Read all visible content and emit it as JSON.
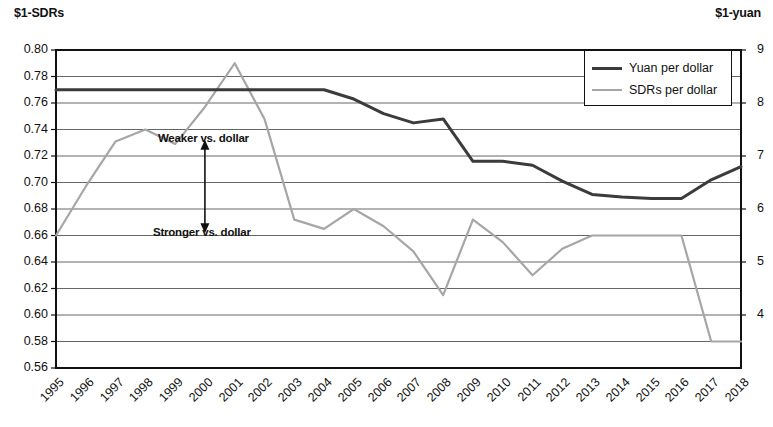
{
  "chart_data": {
    "type": "line",
    "title": "",
    "xlabel": "",
    "ylabel": "$1-SDRs",
    "y2label": "$1-yuan",
    "grid": true,
    "legend_position": "top-right",
    "categories": [
      "1995",
      "1996",
      "1997",
      "1998",
      "1999",
      "2000",
      "2001",
      "2002",
      "2003",
      "2004",
      "2005",
      "2006",
      "2007",
      "2008",
      "2009",
      "2010",
      "2011",
      "2012",
      "2013",
      "2014",
      "2015",
      "2016",
      "2017",
      "2018"
    ],
    "ylim": [
      0.56,
      0.8
    ],
    "yticks": [
      "0.80",
      "0.78",
      "0.76",
      "0.74",
      "0.72",
      "0.70",
      "0.68",
      "0.66",
      "0.64",
      "0.62",
      "0.60",
      "0.58",
      "0.56"
    ],
    "y2lim": [
      3.0,
      9.0
    ],
    "y2ticks": [
      "9",
      "8",
      "7",
      "6",
      "5",
      "4"
    ],
    "series": [
      {
        "name": "Yuan per dollar",
        "color": "#3b3b3b",
        "axis": "left",
        "values": [
          0.77,
          0.77,
          0.77,
          0.77,
          0.77,
          0.77,
          0.77,
          0.77,
          0.77,
          0.77,
          0.763,
          0.752,
          0.745,
          0.748,
          0.716,
          0.716,
          0.713,
          0.701,
          0.691,
          0.689,
          0.688,
          0.688,
          0.702,
          0.712
        ]
      },
      {
        "name": "SDRs per dollar",
        "color": "#a6a6a6",
        "axis": "left",
        "values": [
          0.66,
          0.697,
          0.731,
          0.74,
          0.729,
          0.757,
          0.79,
          0.748,
          0.672,
          0.665,
          0.68,
          0.667,
          0.648,
          0.615,
          0.672,
          0.655,
          0.63,
          0.65,
          0.66,
          0.66,
          0.66,
          0.66,
          0.58,
          0.58
        ]
      }
    ],
    "annotations": [
      {
        "name": "weaker-label",
        "text": "Weaker vs. dollar",
        "x": "2000",
        "y": 0.733
      },
      {
        "name": "stronger-label",
        "text": "Stronger vs. dollar",
        "x": "2000",
        "y": 0.662
      },
      {
        "name": "direction-arrow",
        "text": "",
        "y_top": 0.727,
        "y_bottom": 0.667
      }
    ]
  },
  "legend": {
    "items": [
      {
        "label": "Yuan per dollar",
        "color": "#3b3b3b"
      },
      {
        "label": "SDRs per dollar",
        "color": "#a6a6a6"
      }
    ]
  },
  "axes": {
    "left_unit": "$1-SDRs",
    "right_unit": "$1-yuan"
  }
}
